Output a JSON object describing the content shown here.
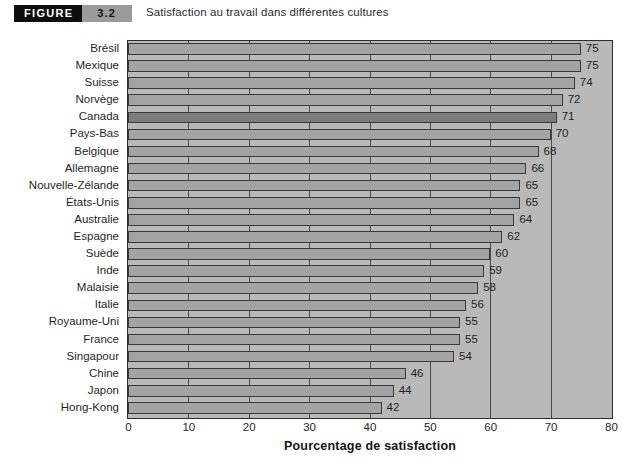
{
  "header": {
    "figure_word": "FIGURE",
    "figure_number": "3.2",
    "caption": "Satisfaction au travail dans différentes cultures"
  },
  "colors": {
    "figure_word_bg": "#0d0d0d",
    "figure_number_bg": "#9b9b9b",
    "plot_background": "#b9b9b9",
    "bar_fill": "#a3a3a3",
    "bar_highlight_fill": "#7d7d7d",
    "bar_border": "#3a3a3a",
    "gridline": "#4a4a4a",
    "frame_border": "#2d2d2d"
  },
  "chart_data": {
    "type": "bar",
    "orientation": "horizontal",
    "title": "Satisfaction au travail dans différentes cultures",
    "xlabel": "Pourcentage de satisfaction",
    "ylabel": "",
    "xlim": [
      0,
      80
    ],
    "xticks": [
      0,
      10,
      20,
      30,
      40,
      50,
      60,
      70,
      80
    ],
    "grid": true,
    "legend": null,
    "highlight_category": "Canada",
    "categories": [
      "Brésil",
      "Mexique",
      "Suisse",
      "Norvège",
      "Canada",
      "Pays-Bas",
      "Belgique",
      "Allemagne",
      "Nouvelle-Zélande",
      "États-Unis",
      "Australie",
      "Espagne",
      "Suède",
      "Inde",
      "Malaisie",
      "Italie",
      "Royaume-Uni",
      "France",
      "Singapour",
      "Chine",
      "Japon",
      "Hong-Kong"
    ],
    "values": [
      75,
      75,
      74,
      72,
      71,
      70,
      68,
      66,
      65,
      65,
      64,
      62,
      60,
      59,
      58,
      56,
      55,
      55,
      54,
      46,
      44,
      42
    ],
    "value_labels": [
      "75",
      "75",
      "74",
      "72",
      "71",
      "70",
      "68",
      "66",
      "65",
      "65",
      "64",
      "62",
      "60",
      "59",
      "58",
      "56",
      "55",
      "55",
      "54",
      "46",
      "44",
      "42"
    ]
  }
}
